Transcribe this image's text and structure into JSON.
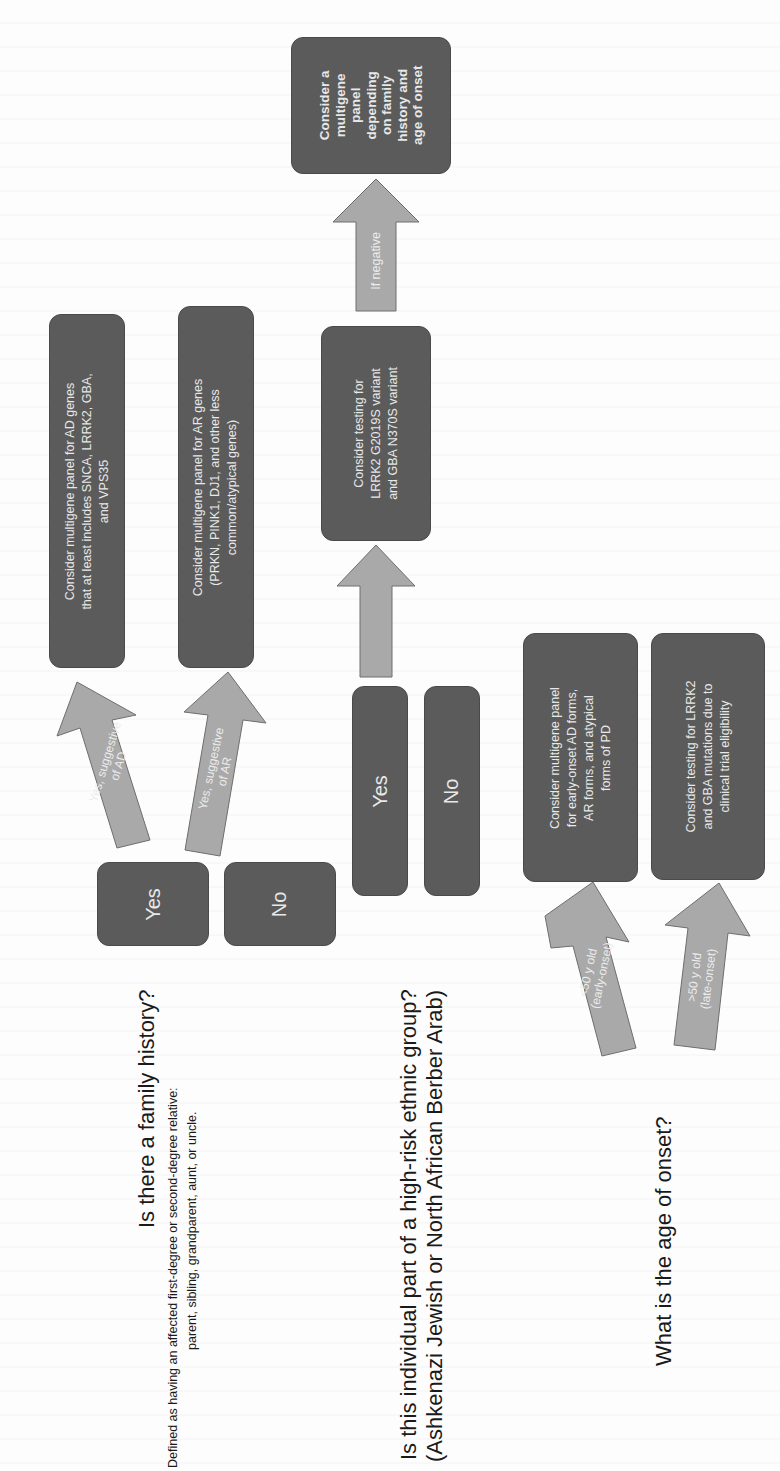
{
  "colors": {
    "box_fill": "#5b5b5b",
    "arrow_fill": "#a9a9a9",
    "arrow_stroke": "#6e6e6e",
    "box_text": "#e8e8e8",
    "question_text": "#1a1a1a"
  },
  "orientation": "rotated 90 degrees counter-clockwise",
  "columns": {
    "family_history": {
      "question": "Is there a family history?",
      "definition_line1": "Defined as having an affected first-degree or second-degree relative:",
      "definition_line2": "parent, sibling, grandparent, aunt, or uncle.",
      "yes_label": "Yes",
      "no_label": "No",
      "arrow_ad_line1": "Yes, suggestive",
      "arrow_ad_line2": "of AD",
      "arrow_ar_line1": "Yes, suggestive",
      "arrow_ar_line2": "of AR",
      "ad_box_line1": "Consider multigene panel for AD genes",
      "ad_box_line2": "that at least includes SNCA, LRRK2, GBA,",
      "ad_box_line3": "and VPS35",
      "ar_box_line1": "Consider multigene panel for AR genes",
      "ar_box_line2": "(PRKN, PINK1, DJ1, and other less",
      "ar_box_line3": "common/atypical genes)"
    },
    "ethnic_group": {
      "question_line1": "Is this individual part of a high-risk ethnic group?",
      "question_line2": "(Ashkenazi Jewish or North African Berber Arab)",
      "yes_label": "Yes",
      "no_label": "No",
      "test_box_line1": "Consider testing for",
      "test_box_line2": "LRRK2 G2019S variant",
      "test_box_line3": "and GBA N370S variant",
      "negative_arrow_label": "If negative",
      "panel_box_lines": [
        "Consider a",
        "multigene",
        "panel",
        "depending",
        "on family",
        "history and",
        "age of onset"
      ]
    },
    "age_of_onset": {
      "question": "What is the age of onset?",
      "early_arrow_line1": "<50 y old",
      "early_arrow_line2": "(early-onset)",
      "late_arrow_line1": ">50 y old",
      "late_arrow_line2": "(late-onset)",
      "early_box_line1": "Consider multigene panel",
      "early_box_line2": "for early-onset AD forms,",
      "early_box_line3": "AR forms, and atypical",
      "early_box_line4": "forms of PD",
      "late_box_line1": "Consider testing for LRRK2",
      "late_box_line2": "and GBA mutations due to",
      "late_box_line3": "clinical trial eligibility"
    }
  }
}
